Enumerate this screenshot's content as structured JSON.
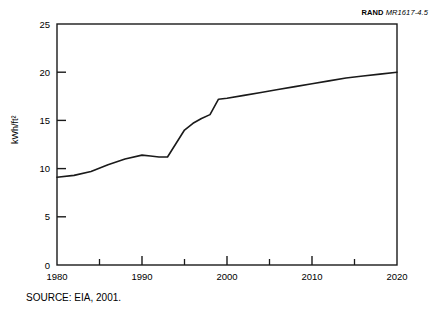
{
  "figure": {
    "rand_label_word": "RAND",
    "rand_label_number": "MR1617-4.5",
    "source_note": "SOURCE: EIA, 2001."
  },
  "chart_data": {
    "type": "line",
    "title": "",
    "xlabel": "",
    "ylabel": "kWh/ft²",
    "xlim": [
      1980,
      2020
    ],
    "ylim": [
      0,
      25
    ],
    "xticks": [
      1980,
      1990,
      2000,
      2010,
      2020
    ],
    "xticklabels": [
      "1980",
      "1990",
      "2000",
      "2010",
      "2020"
    ],
    "xminorticks": [
      1985,
      1995,
      2005,
      2015
    ],
    "yticks": [
      0,
      5,
      10,
      15,
      20,
      25
    ],
    "yticklabels": [
      "0",
      "5",
      "10",
      "15",
      "20",
      "25"
    ],
    "grid": false,
    "legend": false,
    "line_color": "#1a1a1a",
    "line_width": 1.6,
    "x": [
      1980,
      1982,
      1984,
      1986,
      1988,
      1990,
      1991,
      1992,
      1993,
      1994,
      1995,
      1996,
      1997,
      1998,
      1999,
      2000,
      2002,
      2004,
      2006,
      2008,
      2010,
      2012,
      2014,
      2016,
      2018,
      2020
    ],
    "values": [
      9.1,
      9.3,
      9.7,
      10.4,
      11.0,
      11.4,
      11.3,
      11.2,
      11.2,
      12.6,
      14.0,
      14.7,
      15.2,
      15.6,
      17.2,
      17.3,
      17.6,
      17.9,
      18.2,
      18.5,
      18.8,
      19.1,
      19.4,
      19.6,
      19.8,
      20.0
    ]
  }
}
